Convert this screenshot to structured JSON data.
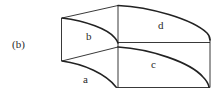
{
  "figure": {
    "panel_label": "(b)",
    "face_labels": {
      "a": "a",
      "b": "b",
      "c": "c",
      "d": "d"
    },
    "colors": {
      "stroke": "#222222",
      "background": "#ffffff"
    }
  }
}
